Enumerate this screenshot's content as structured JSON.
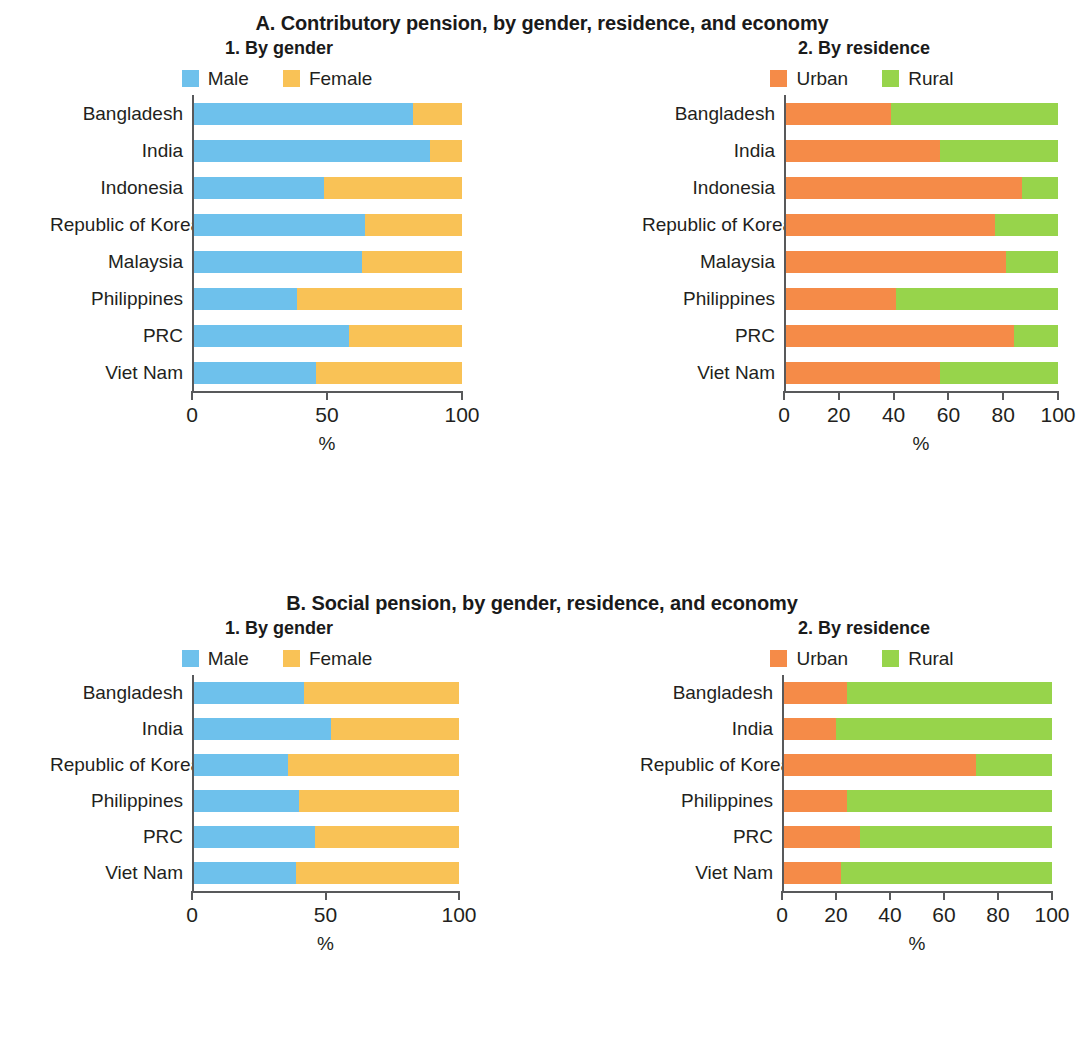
{
  "colors": {
    "male": "#6EC1EC",
    "female": "#F9C256",
    "urban": "#F58B48",
    "rural": "#97D44B",
    "axis": "#58595b",
    "text": "#231f20"
  },
  "sections": [
    {
      "id": "A",
      "title": "A. Contributory pension, by gender, residence, and economy",
      "panels": [
        {
          "id": "A1",
          "title": "1. By gender",
          "legend": [
            {
              "label": "Male",
              "color": "#6EC1EC"
            },
            {
              "label": "Female",
              "color": "#F9C256"
            }
          ],
          "axis": {
            "min": 0,
            "max": 100,
            "ticks": [
              0,
              50,
              100
            ],
            "tick_labels": [
              "0",
              "50",
              "100"
            ],
            "title": "%"
          },
          "categories": [
            "Bangladesh",
            "India",
            "Indonesia",
            "Republic of Korea",
            "Malaysia",
            "Philippines",
            "PRC",
            "Viet Nam"
          ],
          "series": [
            {
              "name": "Male",
              "values": [
                82,
                88,
                49,
                64,
                63,
                39,
                58,
                46
              ]
            },
            {
              "name": "Female",
              "values": [
                18,
                12,
                51,
                36,
                37,
                61,
                42,
                54
              ]
            }
          ]
        },
        {
          "id": "A2",
          "title": "2. By residence",
          "legend": [
            {
              "label": "Urban",
              "color": "#F58B48"
            },
            {
              "label": "Rural",
              "color": "#97D44B"
            }
          ],
          "axis": {
            "min": 0,
            "max": 100,
            "ticks": [
              0,
              20,
              40,
              60,
              80,
              100
            ],
            "tick_labels": [
              "0",
              "20",
              "40",
              "60",
              "80",
              "100"
            ],
            "title": "%"
          },
          "categories": [
            "Bangladesh",
            "India",
            "Indonesia",
            "Republic of Korea",
            "Malaysia",
            "Philippines",
            "PRC",
            "Viet Nam"
          ],
          "series": [
            {
              "name": "Urban",
              "values": [
                39,
                57,
                87,
                77,
                81,
                41,
                84,
                57
              ]
            },
            {
              "name": "Rural",
              "values": [
                61,
                43,
                13,
                23,
                19,
                59,
                16,
                43
              ]
            }
          ]
        }
      ]
    },
    {
      "id": "B",
      "title": "B. Social pension, by gender, residence, and economy",
      "panels": [
        {
          "id": "B1",
          "title": "1. By gender",
          "legend": [
            {
              "label": "Male",
              "color": "#6EC1EC"
            },
            {
              "label": "Female",
              "color": "#F9C256"
            }
          ],
          "axis": {
            "min": 0,
            "max": 100,
            "ticks": [
              0,
              50,
              100
            ],
            "tick_labels": [
              "0",
              "50",
              "100"
            ],
            "title": "%"
          },
          "categories": [
            "Bangladesh",
            "India",
            "Republic of Korea",
            "Philippines",
            "PRC",
            "Viet Nam"
          ],
          "series": [
            {
              "name": "Male",
              "values": [
                42,
                52,
                36,
                40,
                46,
                39
              ]
            },
            {
              "name": "Female",
              "values": [
                58,
                48,
                64,
                60,
                54,
                61
              ]
            }
          ]
        },
        {
          "id": "B2",
          "title": "2. By residence",
          "legend": [
            {
              "label": "Urban",
              "color": "#F58B48"
            },
            {
              "label": "Rural",
              "color": "#97D44B"
            }
          ],
          "axis": {
            "min": 0,
            "max": 100,
            "ticks": [
              0,
              20,
              40,
              60,
              80,
              100
            ],
            "tick_labels": [
              "0",
              "20",
              "40",
              "60",
              "80",
              "100"
            ],
            "title": "%"
          },
          "categories": [
            "Bangladesh",
            "India",
            "Republic of Korea",
            "Philippines",
            "PRC",
            "Viet Nam"
          ],
          "series": [
            {
              "name": "Urban",
              "values": [
                24,
                20,
                72,
                24,
                29,
                22
              ]
            },
            {
              "name": "Rural",
              "values": [
                76,
                80,
                28,
                76,
                71,
                78
              ]
            }
          ]
        }
      ]
    }
  ],
  "chart_data": [
    {
      "type": "bar",
      "orientation": "horizontal",
      "stacked": true,
      "normalized": true,
      "title": "A. Contributory pension, by gender, residence, and economy",
      "subtitle": "1. By gender",
      "xlabel": "%",
      "ylabel": "",
      "xlim": [
        0,
        100
      ],
      "xticks": [
        0,
        50,
        100
      ],
      "grid": false,
      "legend_position": "top-center",
      "categories": [
        "Bangladesh",
        "India",
        "Indonesia",
        "Republic of Korea",
        "Malaysia",
        "Philippines",
        "PRC",
        "Viet Nam"
      ],
      "series": [
        {
          "name": "Male",
          "color": "#6EC1EC",
          "values": [
            82,
            88,
            49,
            64,
            63,
            39,
            58,
            46
          ]
        },
        {
          "name": "Female",
          "color": "#F9C256",
          "values": [
            18,
            12,
            51,
            36,
            37,
            61,
            42,
            54
          ]
        }
      ]
    },
    {
      "type": "bar",
      "orientation": "horizontal",
      "stacked": true,
      "normalized": true,
      "title": "A. Contributory pension, by gender, residence, and economy",
      "subtitle": "2. By residence",
      "xlabel": "%",
      "ylabel": "",
      "xlim": [
        0,
        100
      ],
      "xticks": [
        0,
        20,
        40,
        60,
        80,
        100
      ],
      "grid": false,
      "legend_position": "top-center",
      "categories": [
        "Bangladesh",
        "India",
        "Indonesia",
        "Republic of Korea",
        "Malaysia",
        "Philippines",
        "PRC",
        "Viet Nam"
      ],
      "series": [
        {
          "name": "Urban",
          "color": "#F58B48",
          "values": [
            39,
            57,
            87,
            77,
            81,
            41,
            84,
            57
          ]
        },
        {
          "name": "Rural",
          "color": "#97D44B",
          "values": [
            61,
            43,
            13,
            23,
            19,
            59,
            16,
            43
          ]
        }
      ]
    },
    {
      "type": "bar",
      "orientation": "horizontal",
      "stacked": true,
      "normalized": true,
      "title": "B. Social pension, by gender, residence, and economy",
      "subtitle": "1. By gender",
      "xlabel": "%",
      "ylabel": "",
      "xlim": [
        0,
        100
      ],
      "xticks": [
        0,
        50,
        100
      ],
      "grid": false,
      "legend_position": "top-center",
      "categories": [
        "Bangladesh",
        "India",
        "Republic of Korea",
        "Philippines",
        "PRC",
        "Viet Nam"
      ],
      "series": [
        {
          "name": "Male",
          "color": "#6EC1EC",
          "values": [
            42,
            52,
            36,
            40,
            46,
            39
          ]
        },
        {
          "name": "Female",
          "color": "#F9C256",
          "values": [
            58,
            48,
            64,
            60,
            54,
            61
          ]
        }
      ]
    },
    {
      "type": "bar",
      "orientation": "horizontal",
      "stacked": true,
      "normalized": true,
      "title": "B. Social pension, by gender, residence, and economy",
      "subtitle": "2. By residence",
      "xlabel": "%",
      "ylabel": "",
      "xlim": [
        0,
        100
      ],
      "xticks": [
        0,
        20,
        40,
        60,
        80,
        100
      ],
      "grid": false,
      "legend_position": "top-center",
      "categories": [
        "Bangladesh",
        "India",
        "Republic of Korea",
        "Philippines",
        "PRC",
        "Viet Nam"
      ],
      "series": [
        {
          "name": "Urban",
          "color": "#F58B48",
          "values": [
            24,
            20,
            72,
            24,
            29,
            22
          ]
        },
        {
          "name": "Rural",
          "color": "#97D44B",
          "values": [
            76,
            80,
            28,
            76,
            71,
            78
          ]
        }
      ]
    }
  ]
}
